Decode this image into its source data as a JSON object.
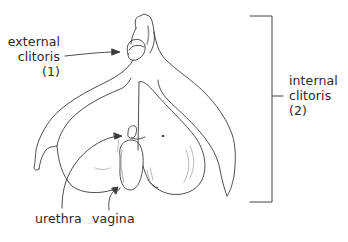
{
  "diagram": {
    "colors": {
      "background": "#ffffff",
      "ink": "#3a3a3a",
      "shading": "#b8b8b8",
      "text": "#2a2a2a"
    },
    "labels": {
      "external": {
        "line1": "external",
        "line2": "clitoris",
        "line3": "(1)"
      },
      "internal": {
        "line1": "internal",
        "line2": "clitoris",
        "line3": "(2)"
      },
      "urethra": "urethra",
      "vagina": "vagina"
    }
  }
}
